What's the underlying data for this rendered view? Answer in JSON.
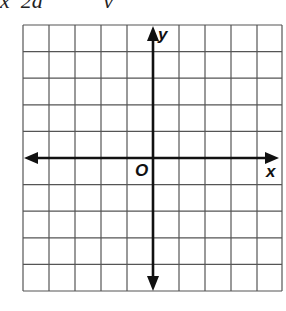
{
  "header": {
    "clipped_text": "x  2a           y"
  },
  "graph": {
    "grid_columns": 10,
    "grid_rows": 10,
    "origin_column": 5,
    "origin_row": 5,
    "line_color": "#555555",
    "axis_color": "#111111",
    "labels": {
      "y_axis": "y",
      "x_axis": "x",
      "origin": "O"
    }
  }
}
